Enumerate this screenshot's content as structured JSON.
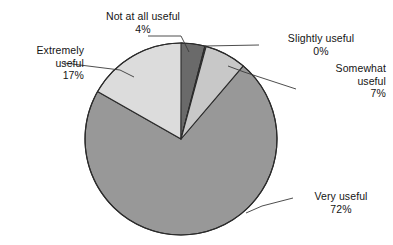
{
  "chart_data": {
    "type": "pie",
    "title": "",
    "subtitle": "",
    "xlabel": "",
    "ylabel": "",
    "legend_position": "none",
    "grid": false,
    "labels_outside": true,
    "categories": [
      "Not at all useful",
      "Slightly useful",
      "Somewhat useful",
      "Very useful",
      "Extremely useful"
    ],
    "values": [
      4,
      0,
      7,
      72,
      17
    ],
    "value_labels": [
      "4%",
      "0%",
      "7%",
      "72%",
      "17%"
    ],
    "units": "percent",
    "start_angle_deg": 0,
    "direction": "clockwise",
    "slices": [
      {
        "name": "Not at all useful",
        "value": 4,
        "value_label": "4%",
        "color": "#6a6a6a"
      },
      {
        "name": "Slightly useful",
        "value": 0,
        "value_label": "0%",
        "color": "#3c3c3c"
      },
      {
        "name": "Somewhat useful",
        "value": 7,
        "value_label": "7%",
        "color": "#c8c8c8"
      },
      {
        "name": "Very useful",
        "value": 72,
        "value_label": "72%",
        "color": "#989898"
      },
      {
        "name": "Extremely useful",
        "value": 17,
        "value_label": "17%",
        "color": "#dcdcdc"
      }
    ]
  },
  "callouts": {
    "not_at_all": {
      "label": "Not at all useful",
      "percent": "4%"
    },
    "slightly": {
      "label": "Slightly useful",
      "percent": "0%"
    },
    "somewhat": {
      "label_line1": "Somewhat",
      "label_line2": "useful",
      "percent": "7%"
    },
    "extremely": {
      "label_line1": "Extremely",
      "label_line2": "useful",
      "percent": "17%"
    },
    "very": {
      "label": "Very useful",
      "percent": "72%"
    }
  },
  "style": {
    "background": "#ffffff",
    "outline": "#2b2b2b",
    "leader_line": "#3a3a3a",
    "text": "#141414"
  }
}
